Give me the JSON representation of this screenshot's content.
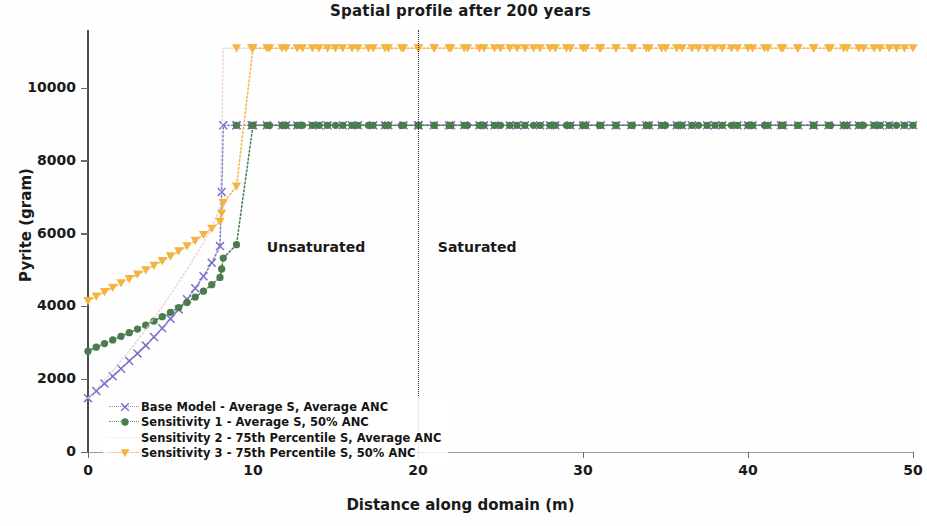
{
  "chart_data": {
    "type": "line",
    "title": "Spatial profile after 200 years",
    "xlabel": "Distance along domain (m)",
    "ylabel": "Pyrite (gram)",
    "xlim": [
      0,
      50
    ],
    "ylim": [
      0,
      11600
    ],
    "xticks": [
      0,
      10,
      20,
      30,
      40,
      50
    ],
    "yticks": [
      0,
      2000,
      4000,
      6000,
      8000,
      10000
    ],
    "grid": false,
    "legend_position": "lower left",
    "annotations": [
      {
        "text": "Unsaturated",
        "x": 16.8,
        "y": 5600
      },
      {
        "text": "Saturated",
        "x": 21.2,
        "y": 5600
      }
    ],
    "vertical_line": {
      "x": 20,
      "style": "dotted",
      "color": "#2b2b2b"
    },
    "series": [
      {
        "name": "Base Model - Average S, Average ANC",
        "color": "#7b74c9",
        "marker": "x",
        "linestyle": "dotted",
        "x": [
          0,
          0.5,
          1,
          1.5,
          2,
          2.5,
          3,
          3.5,
          4,
          4.5,
          5,
          5.5,
          6,
          6.5,
          7,
          7.5,
          8,
          8.1,
          8.2,
          9,
          10,
          12,
          14,
          16,
          18,
          20,
          22,
          24,
          26,
          28,
          30,
          32,
          34,
          36,
          38,
          40,
          42,
          44,
          46,
          48,
          50
        ],
        "y": [
          1480,
          1680,
          1880,
          2080,
          2290,
          2500,
          2710,
          2930,
          3160,
          3400,
          3660,
          3920,
          4200,
          4500,
          4830,
          5200,
          5660,
          7150,
          8980,
          8980,
          8980,
          8980,
          8980,
          8980,
          8980,
          8980,
          8980,
          8980,
          8980,
          8980,
          8980,
          8980,
          8980,
          8980,
          8980,
          8980,
          8980,
          8980,
          8980,
          8980,
          8980
        ]
      },
      {
        "name": "Sensitivity 1 - Average S, 50% ANC",
        "color": "#4a7c4e",
        "marker": "o",
        "linestyle": "dotted",
        "x": [
          0,
          0.5,
          1,
          1.5,
          2,
          2.5,
          3,
          3.5,
          4,
          4.5,
          5,
          5.5,
          6,
          6.5,
          7,
          7.5,
          8,
          8.1,
          8.2,
          9,
          10,
          11,
          12,
          13,
          14,
          15,
          16,
          17,
          18,
          19,
          20,
          21,
          22,
          23,
          24,
          25,
          26,
          27,
          28,
          29,
          30,
          31,
          32,
          33,
          34,
          35,
          36,
          37,
          38,
          39,
          40,
          41,
          42,
          43,
          44,
          45,
          46,
          47,
          48,
          49,
          50
        ],
        "y": [
          2770,
          2880,
          2980,
          3080,
          3180,
          3280,
          3380,
          3490,
          3600,
          3720,
          3840,
          3970,
          4110,
          4260,
          4420,
          4600,
          4800,
          5030,
          5330,
          5700,
          8980,
          8980,
          8980,
          8980,
          8980,
          8980,
          8980,
          8980,
          8980,
          8980,
          8980,
          8980,
          8980,
          8980,
          8980,
          8980,
          8980,
          8980,
          8980,
          8980,
          8980,
          8980,
          8980,
          8980,
          8980,
          8980,
          8980,
          8980,
          8980,
          8980,
          8980,
          8980,
          8980,
          8980,
          8980,
          8980,
          8980,
          8980,
          8980,
          8980,
          8980
        ]
      },
      {
        "name": "Sensitivity 2 - 75th Percentile S, Average ANC",
        "color": "#efc9d4",
        "marker": "none",
        "linestyle": "dotted",
        "x": [
          0,
          0.5,
          1,
          1.5,
          2,
          2.5,
          3,
          3.5,
          4,
          4.5,
          5,
          5.5,
          6,
          6.5,
          7,
          7.5,
          8,
          8.1,
          8.2,
          9,
          10,
          12,
          14,
          16,
          18,
          20,
          25,
          30,
          35,
          40,
          45,
          50
        ],
        "y": [
          1480,
          1720,
          1970,
          2230,
          2500,
          2780,
          3070,
          3370,
          3680,
          4000,
          4330,
          4670,
          5020,
          5380,
          5760,
          6180,
          6700,
          8400,
          11100,
          11100,
          11100,
          11100,
          11100,
          11100,
          11100,
          11100,
          11100,
          11100,
          11100,
          11100,
          11100,
          11100
        ]
      },
      {
        "name": "Sensitivity 3 - 75th Percentile S, 50% ANC",
        "color": "#f5b342",
        "marker": "v",
        "linestyle": "dotted",
        "x": [
          0,
          0.5,
          1,
          1.5,
          2,
          2.5,
          3,
          3.5,
          4,
          4.5,
          5,
          5.5,
          6,
          6.5,
          7,
          7.5,
          8,
          8.1,
          8.2,
          9,
          10,
          11,
          12,
          13,
          14,
          15,
          16,
          17,
          18,
          19,
          20,
          21,
          22,
          23,
          24,
          25,
          26,
          27,
          28,
          29,
          30,
          31,
          32,
          33,
          34,
          35,
          36,
          37,
          38,
          39,
          40,
          41,
          42,
          43,
          44,
          45,
          46,
          47,
          48,
          49,
          50
        ],
        "y": [
          4150,
          4280,
          4400,
          4520,
          4640,
          4760,
          4880,
          5000,
          5120,
          5250,
          5380,
          5520,
          5660,
          5810,
          5970,
          6140,
          6330,
          6560,
          6850,
          7300,
          11100,
          11100,
          11100,
          11100,
          11100,
          11100,
          11100,
          11100,
          11100,
          11100,
          11100,
          11100,
          11100,
          11100,
          11100,
          11100,
          11100,
          11100,
          11100,
          11100,
          11100,
          11100,
          11100,
          11100,
          11100,
          11100,
          11100,
          11100,
          11100,
          11100,
          11100,
          11100,
          11100,
          11100,
          11100,
          11100,
          11100,
          11100,
          11100,
          11100,
          11100
        ]
      }
    ]
  },
  "legend": {
    "items": [
      {
        "label": "Base Model - Average S, Average ANC",
        "color": "#7b74c9",
        "marker": "x"
      },
      {
        "label": "Sensitivity 1 - Average S, 50% ANC",
        "color": "#4a7c4e",
        "marker": "o"
      },
      {
        "label": "Sensitivity 2 - 75th Percentile S, Average ANC",
        "color": "#efc9d4",
        "marker": "none"
      },
      {
        "label": "Sensitivity 3 - 75th Percentile S, 50% ANC",
        "color": "#f5b342",
        "marker": "v"
      }
    ]
  }
}
